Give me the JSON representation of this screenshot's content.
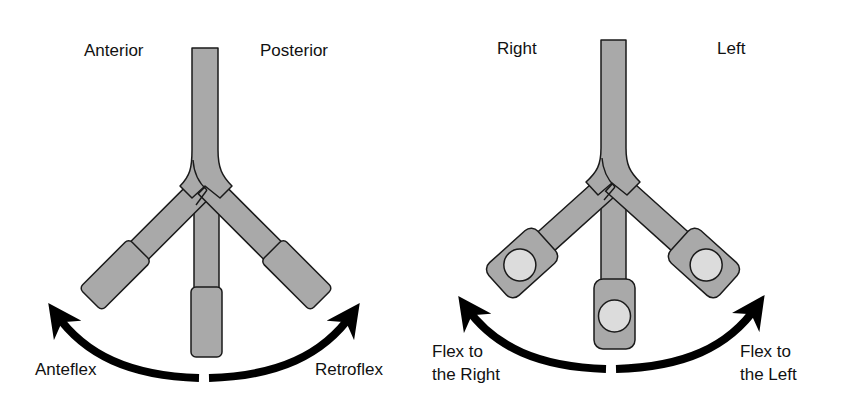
{
  "diagrams": [
    {
      "id": "anterior-posterior",
      "top_left_label": "Anterior",
      "top_right_label": "Posterior",
      "bottom_left_label": "Anteflex",
      "bottom_right_label": "Retroflex",
      "tip_style": "plain"
    },
    {
      "id": "right-left",
      "top_left_label": "Right",
      "top_right_label": "Left",
      "bottom_left_label_line1": "Flex to",
      "bottom_left_label_line2": "the Right",
      "bottom_right_label_line1": "Flex to",
      "bottom_right_label_line2": "the Left",
      "tip_style": "with-lens-circle"
    }
  ],
  "colors": {
    "shaft_fill": "#a9a9a9",
    "outline": "#1a1a1a",
    "lens_fill": "#dcdcdc",
    "arrow": "#000000",
    "text": "#111111"
  }
}
